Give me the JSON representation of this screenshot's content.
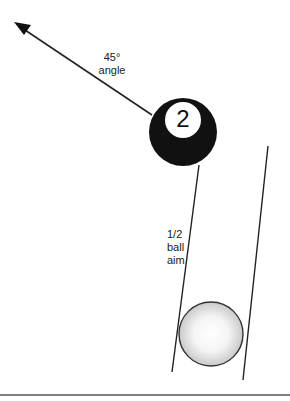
{
  "diagram": {
    "object_ball": {
      "number": "2",
      "color": "#111111"
    },
    "cue_ball": {
      "color": "#ffffff"
    },
    "labels": {
      "angle_line1": "45°",
      "angle_line2": "angle",
      "aim_line1": "1/2",
      "aim_line2": "ball",
      "aim_line3": "aim"
    }
  }
}
